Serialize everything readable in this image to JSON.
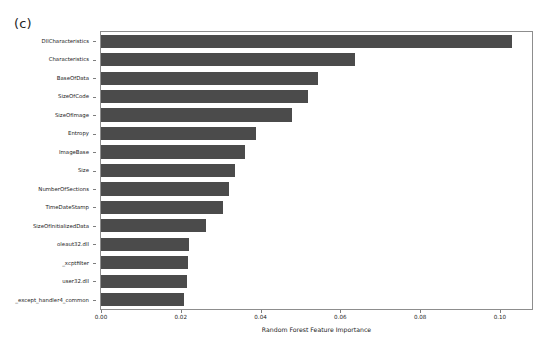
{
  "figure": {
    "panel_label": "(c)",
    "bar_color": "#4b4b4b",
    "axis_color": "#8d8d8d",
    "background": "#ffffff"
  },
  "chart_data": {
    "type": "bar",
    "orientation": "horizontal",
    "title": "",
    "xlabel": "Random Forest Feature Importance",
    "ylabel": "",
    "xlim": [
      0.0,
      0.1083
    ],
    "grid": false,
    "legend": null,
    "xticks": [
      0.0,
      0.02,
      0.04,
      0.06,
      0.08,
      0.1
    ],
    "xtick_labels": [
      "0.00",
      "0.02",
      "0.04",
      "0.06",
      "0.08",
      "0.10"
    ],
    "categories": [
      "DllCharacteristics",
      "Characteristics",
      "BaseOfData",
      "SizeOfCode",
      "SizeOfImage",
      "Entropy",
      "ImageBase",
      "Size",
      "NumberOfSections",
      "TimeDateStamp",
      "SizeOfInitializedData",
      "oleaut32.dll",
      "_xcptfilter",
      "user32.dll",
      "_except_handler4_common"
    ],
    "values": [
      0.103,
      0.0638,
      0.0543,
      0.0518,
      0.0478,
      0.0388,
      0.036,
      0.0335,
      0.032,
      0.0305,
      0.0263,
      0.022,
      0.0218,
      0.0215,
      0.0208
    ]
  }
}
